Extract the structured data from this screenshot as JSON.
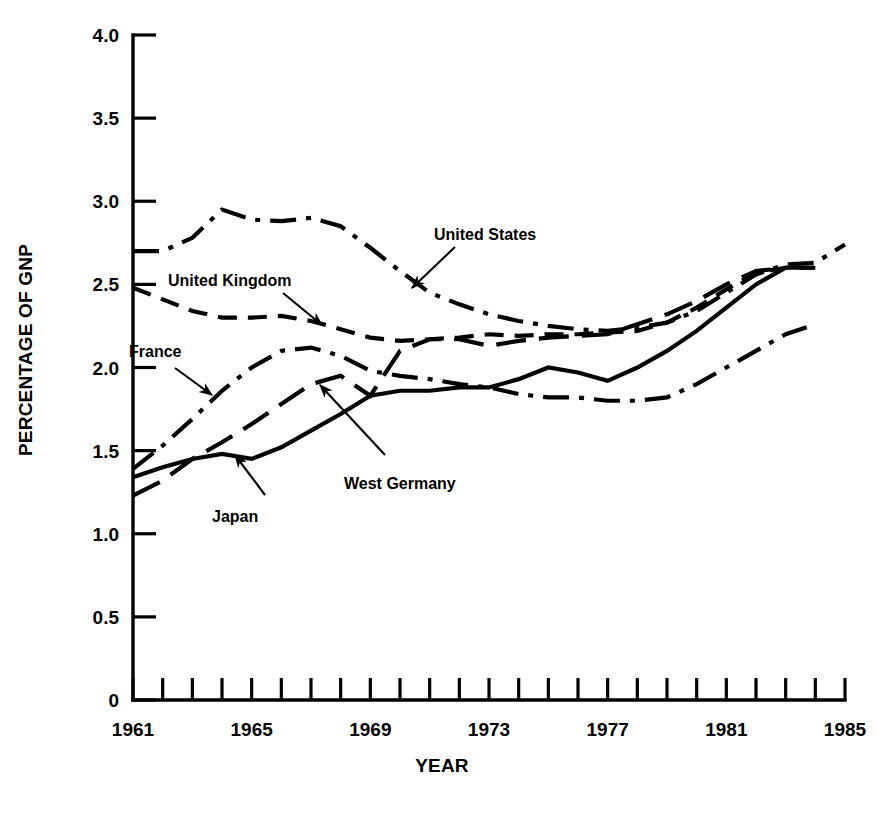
{
  "chart_data": {
    "type": "line",
    "title": "",
    "xlabel": "YEAR",
    "ylabel": "PERCENTAGE OF GNP",
    "xlim": [
      1961,
      1985
    ],
    "ylim": [
      0,
      4.0
    ],
    "grid": false,
    "legend_position": "inline-annotations",
    "x_ticks": [
      1961,
      1962,
      1963,
      1964,
      1965,
      1966,
      1967,
      1968,
      1969,
      1970,
      1971,
      1972,
      1973,
      1974,
      1975,
      1976,
      1977,
      1978,
      1979,
      1980,
      1981,
      1982,
      1983,
      1984,
      1985
    ],
    "x_tick_labels": [
      "1961",
      "",
      "",
      "",
      "1965",
      "",
      "",
      "",
      "1969",
      "",
      "",
      "",
      "1973",
      "",
      "",
      "",
      "1977",
      "",
      "",
      "",
      "1981",
      "",
      "",
      "",
      "1985"
    ],
    "y_ticks": [
      0,
      0.5,
      1.0,
      1.5,
      2.0,
      2.5,
      3.0,
      3.5,
      4.0
    ],
    "y_tick_labels": [
      "0",
      "0.5",
      "1.0",
      "1.5",
      "2.0",
      "2.5",
      "3.0",
      "3.5",
      "4.0"
    ],
    "series": [
      {
        "name": "United States",
        "style": "dash-dot",
        "x": [
          1961,
          1962,
          1963,
          1964,
          1965,
          1966,
          1967,
          1968,
          1969,
          1970,
          1971,
          1972,
          1973,
          1974,
          1975,
          1976,
          1977,
          1978,
          1979,
          1980,
          1981,
          1982,
          1983,
          1984,
          1985
        ],
        "values": [
          2.7,
          2.7,
          2.78,
          2.95,
          2.89,
          2.88,
          2.9,
          2.85,
          2.72,
          2.58,
          2.45,
          2.38,
          2.32,
          2.28,
          2.25,
          2.23,
          2.22,
          2.24,
          2.27,
          2.34,
          2.45,
          2.56,
          2.62,
          2.63,
          2.74
        ]
      },
      {
        "name": "United Kingdom",
        "style": "dashed",
        "x": [
          1961,
          1962,
          1963,
          1964,
          1965,
          1966,
          1967,
          1968,
          1969,
          1970,
          1971,
          1972,
          1973,
          1974,
          1975,
          1976,
          1977,
          1978,
          1979,
          1980,
          1981,
          1982,
          1983,
          1984
        ],
        "values": [
          2.48,
          2.41,
          2.34,
          2.3,
          2.3,
          2.31,
          2.28,
          2.23,
          2.18,
          2.16,
          2.17,
          2.18,
          2.2,
          2.19,
          2.2,
          2.2,
          2.21,
          2.22,
          2.27,
          2.36,
          2.47,
          2.57,
          2.6,
          2.6
        ]
      },
      {
        "name": "France",
        "style": "dash-dot",
        "x": [
          1961,
          1962,
          1963,
          1964,
          1965,
          1966,
          1967,
          1968,
          1969,
          1970,
          1971,
          1972,
          1973,
          1974,
          1975,
          1976,
          1977,
          1978,
          1979,
          1980,
          1981,
          1982,
          1983,
          1984
        ],
        "values": [
          1.39,
          1.53,
          1.69,
          1.86,
          2.0,
          2.1,
          2.12,
          2.07,
          1.98,
          1.95,
          1.93,
          1.9,
          1.88,
          1.84,
          1.82,
          1.82,
          1.8,
          1.8,
          1.82,
          1.9,
          2.0,
          2.1,
          2.2,
          2.26
        ]
      },
      {
        "name": "West Germany",
        "style": "solid",
        "x": [
          1961,
          1962,
          1963,
          1964,
          1965,
          1966,
          1967,
          1968,
          1969,
          1970,
          1971,
          1972,
          1973,
          1974,
          1975,
          1976,
          1977,
          1978,
          1979,
          1980,
          1981,
          1982,
          1983
        ],
        "values": [
          1.34,
          1.4,
          1.45,
          1.48,
          1.45,
          1.52,
          1.62,
          1.72,
          1.83,
          1.86,
          1.86,
          1.88,
          1.88,
          1.93,
          2.0,
          1.97,
          1.92,
          2.0,
          2.1,
          2.22,
          2.36,
          2.5,
          2.6
        ]
      },
      {
        "name": "Japan",
        "style": "long-dash",
        "x": [
          1961,
          1962,
          1963,
          1964,
          1965,
          1966,
          1967,
          1968,
          1969,
          1970,
          1971,
          1972,
          1973,
          1974,
          1975,
          1976,
          1977,
          1978,
          1979,
          1980,
          1981,
          1982,
          1983,
          1984
        ],
        "values": [
          1.23,
          1.32,
          1.45,
          1.55,
          1.66,
          1.78,
          1.9,
          1.95,
          1.83,
          2.1,
          2.17,
          2.17,
          2.13,
          2.16,
          2.18,
          2.19,
          2.2,
          2.26,
          2.32,
          2.4,
          2.5,
          2.58,
          2.6,
          2.6
        ]
      }
    ],
    "annotations": [
      {
        "label": "United States",
        "style": "dash-dot"
      },
      {
        "label": "United Kingdom",
        "style": "dashed"
      },
      {
        "label": "France",
        "style": "dash-dot"
      },
      {
        "label": "West Germany",
        "style": "solid"
      },
      {
        "label": "Japan",
        "style": "long-dash"
      }
    ]
  },
  "axes": {
    "ylabel": "PERCENTAGE OF GNP",
    "xlabel": "YEAR",
    "y_tick_labels": [
      "4.0",
      "3.5",
      "3.0",
      "2.5",
      "2.0",
      "1.5",
      "1.0",
      "0.5",
      "0"
    ],
    "x_tick_labels": [
      "1961",
      "1965",
      "1969",
      "1973",
      "1977",
      "1981",
      "1985"
    ]
  },
  "labels": {
    "united_states": "United States",
    "united_kingdom": "United Kingdom",
    "france": "France",
    "west_germany": "West Germany",
    "japan": "Japan"
  },
  "colors": {
    "ink": "#000000",
    "background": "#ffffff"
  }
}
